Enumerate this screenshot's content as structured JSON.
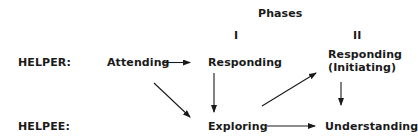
{
  "diagram": {
    "header": "Phases",
    "phases": [
      {
        "label": "I"
      },
      {
        "label": "II"
      }
    ],
    "rows": {
      "helper": "HELPER:",
      "helpee": "HELPEE:"
    },
    "nodes": {
      "attending": "Attending",
      "responding_1": "Responding",
      "responding_2_line1": "Responding",
      "responding_2_line2": "(Initiating)",
      "exploring": "Exploring",
      "understanding": "Understanding"
    },
    "edges": [
      {
        "from": "Attending",
        "to": "Responding (I)"
      },
      {
        "from": "Attending",
        "to": "Exploring"
      },
      {
        "from": "Responding (I)",
        "to": "Exploring"
      },
      {
        "from": "Exploring",
        "to": "Responding (Initiating)"
      },
      {
        "from": "Exploring",
        "to": "Understanding"
      },
      {
        "from": "Responding (Initiating)",
        "to": "Understanding"
      }
    ],
    "color": "#1a1a1a"
  }
}
